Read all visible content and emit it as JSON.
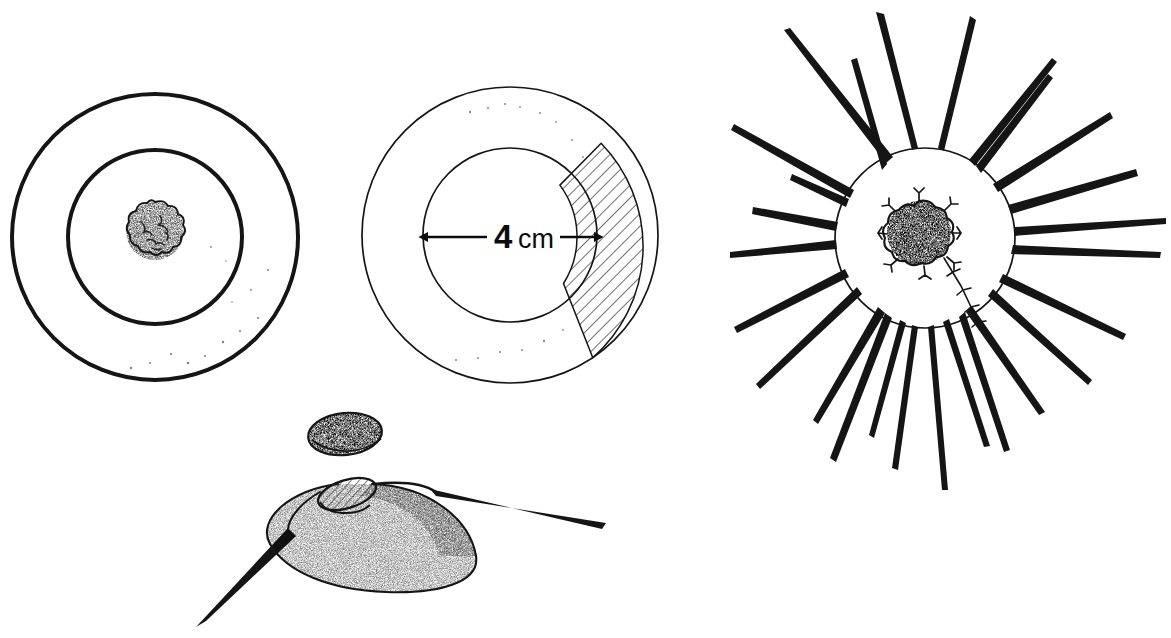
{
  "figure": {
    "kind": "scientific-line-drawing",
    "background_color": "#ffffff",
    "ink_color": "#151515",
    "panel_count": 4
  },
  "scale_bar": {
    "value": "4",
    "unit": "cm",
    "full_label": "4 cm",
    "orientation": "horizontal",
    "span_px": 174,
    "line_y": 237,
    "x_start": 424,
    "x_end": 598
  },
  "panels": [
    {
      "id": "panel-left",
      "name": "concentric-disc-view",
      "center": [
        155,
        237
      ],
      "outer_radius": 143,
      "inner_radius": 87,
      "nucleus_radius": 30,
      "nucleus_center": [
        155,
        231
      ],
      "stipple_side": "left",
      "outer_stroke_width": 4,
      "inner_stroke_width": 4
    },
    {
      "id": "panel-middle",
      "name": "annulus-with-hatched-sector",
      "center": [
        510,
        235
      ],
      "outer_radius": 148,
      "inner_radius": 87,
      "hatch_sector_start_deg": -56,
      "hatch_sector_end_deg": 52,
      "hatch_angle_deg": 45,
      "hatch_spacing_px": 9,
      "stipple_side": "left",
      "outer_stroke_width": 1.6,
      "inner_stroke_width": 1.6
    },
    {
      "id": "panel-right",
      "name": "radiating-spined-body",
      "center": [
        925,
        238
      ],
      "body_radius": 90,
      "nucleus_center": [
        919,
        233
      ],
      "nucleus_radius": 33,
      "spine_count": 22,
      "spine_min_length": 95,
      "spine_max_length": 270,
      "stipple_side": "left",
      "body_stroke_width": 1.6
    },
    {
      "id": "panel-bottom",
      "name": "lateral-dome-view",
      "small_oval": {
        "center": [
          345,
          434
        ],
        "rx": 37,
        "ry": 21,
        "rotation_deg": -6
      },
      "dome": {
        "apex": [
          372,
          485
        ],
        "left_extent": 262,
        "right_extent": 478,
        "base_y": 592
      },
      "aperture": {
        "center": [
          347,
          494
        ],
        "rx": 30,
        "ry": 14,
        "rotation_deg": -17,
        "fill": "hatched",
        "hatch_angle_deg": 45
      },
      "spines": [
        {
          "name": "spine-lower-left",
          "tip": [
            196,
            627
          ]
        },
        {
          "name": "spine-right",
          "tip": [
            606,
            523
          ]
        }
      ]
    }
  ]
}
